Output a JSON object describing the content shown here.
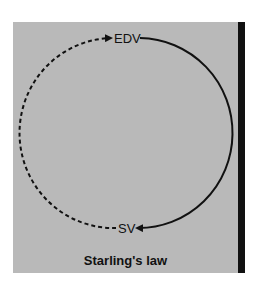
{
  "diagram": {
    "title": "Starling's law",
    "nodes": {
      "top": {
        "label": "EDV"
      },
      "bottom": {
        "label": "SV"
      }
    },
    "edges": [
      {
        "from": "EDV",
        "to": "SV",
        "style": "solid",
        "direction": "clockwise-right-side"
      },
      {
        "from": "SV",
        "to": "EDV",
        "style": "dashed",
        "direction": "clockwise-left-side"
      }
    ],
    "colors": {
      "background": "#b9b9b9",
      "line": "#111111",
      "side_bar": "#111111"
    }
  }
}
